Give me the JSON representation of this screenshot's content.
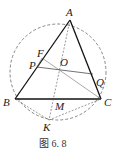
{
  "figure": {
    "caption": "图 6. 8",
    "points": {
      "A": {
        "label": "A",
        "x": 70,
        "y": 20
      },
      "B": {
        "label": "B",
        "x": 15,
        "y": 99
      },
      "C": {
        "label": "C",
        "x": 101,
        "y": 99
      },
      "K": {
        "label": "K",
        "x": 49,
        "y": 120
      },
      "O": {
        "label": "O",
        "x": 59,
        "y": 67
      },
      "F": {
        "label": "F",
        "x": 42,
        "y": 58
      },
      "P": {
        "label": "P",
        "x": 37,
        "y": 67
      },
      "Q": {
        "label": "Q",
        "x": 93,
        "y": 74
      },
      "M": {
        "label": "M",
        "x": 53,
        "y": 99
      }
    },
    "circle": {
      "cx": 58,
      "cy": 72,
      "r": 48,
      "style": "dashed"
    },
    "solid_segments": [
      "AB",
      "AC",
      "BC",
      "PQ"
    ],
    "thin_segments": [
      "FO",
      "OC",
      "FC"
    ],
    "dashed_segments": [
      "AK",
      "BK",
      "KC"
    ]
  }
}
